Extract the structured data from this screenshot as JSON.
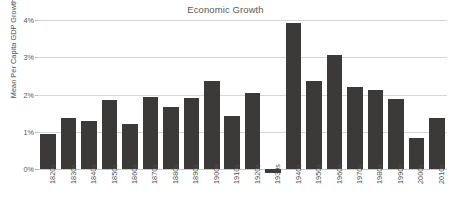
{
  "chart_data": {
    "type": "bar",
    "title": "Economic Growth",
    "xlabel": "",
    "ylabel": "Mean Per Capita GDP Growth",
    "ylim": [
      -0.15,
      4.1
    ],
    "ytick_values": [
      0,
      1,
      2,
      3,
      4
    ],
    "ytick_labels": [
      "0%",
      "1%",
      "2%",
      "3%",
      "4%"
    ],
    "grid": true,
    "legend": "none",
    "bar_color": "#3b3a39",
    "grid_color": "#d6d6d6",
    "background_color": "#ffffff",
    "categories": [
      "1820s",
      "1830s",
      "1840s",
      "1850s",
      "1860s",
      "1870s",
      "1880s",
      "1890s",
      "1900s",
      "1910s",
      "1920s",
      "1930s",
      "1940s",
      "1950s",
      "1960s",
      "1970s",
      "1980s",
      "1990s",
      "2000s",
      "2010s"
    ],
    "values": [
      0.93,
      1.38,
      1.3,
      1.86,
      1.21,
      1.94,
      1.67,
      1.9,
      2.35,
      1.41,
      2.05,
      -0.12,
      3.93,
      2.37,
      3.06,
      2.19,
      2.11,
      1.89,
      0.82,
      1.36
    ]
  }
}
